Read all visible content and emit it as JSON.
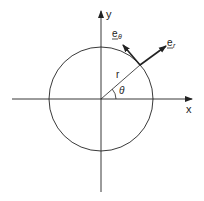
{
  "diagram": {
    "axes": {
      "x_label": "x",
      "y_label": "y"
    },
    "labels": {
      "radius": "r",
      "angle": "θ",
      "e_r": "e",
      "e_r_sub": "r",
      "e_theta": "e",
      "e_theta_sub": "θ"
    },
    "colors": {
      "stroke": "#222222",
      "background": "#ffffff"
    }
  }
}
